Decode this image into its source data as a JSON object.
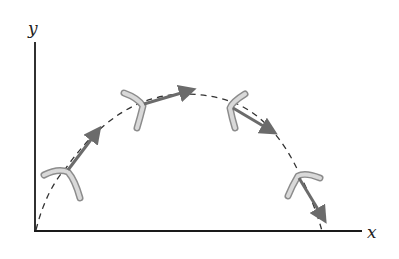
{
  "diagram": {
    "axes": {
      "x_label": "x",
      "y_label": "y"
    },
    "colors": {
      "axis": "#1a1a1a",
      "path": "#333333",
      "boomerang_fill": "#d4d4d4",
      "boomerang_edge": "#8c8c8c",
      "arrow": "#6b6b6b"
    },
    "path": {
      "style": "dashed",
      "shape": "parabola"
    },
    "boomerangs": [
      {
        "id": 1,
        "position": "lower-left",
        "velocity_direction": "up-right"
      },
      {
        "id": 2,
        "position": "upper-left",
        "velocity_direction": "right"
      },
      {
        "id": 3,
        "position": "upper-right",
        "velocity_direction": "down-right"
      },
      {
        "id": 4,
        "position": "lower-right",
        "velocity_direction": "down"
      }
    ]
  }
}
